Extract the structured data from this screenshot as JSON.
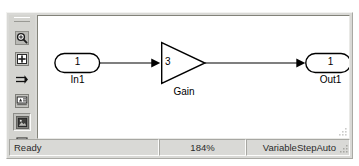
{
  "window": {
    "name": "simulink-model-window"
  },
  "toolbar": {
    "name": "simulink-left-toolbar",
    "items": [
      {
        "icon": "zoom-magnifier-icon",
        "label": "Zoom",
        "pressed": false
      },
      {
        "icon": "fit-to-view-icon",
        "label": "Fit to view",
        "pressed": false
      },
      {
        "icon": "signal-flow-arrow-icon",
        "label": "Signal flow",
        "pressed": false
      },
      {
        "icon": "label-block-icon",
        "label": "Block label",
        "pressed": false
      },
      {
        "icon": "image-block-icon",
        "label": "Image block",
        "pressed": true
      },
      {
        "icon": "empty-square-icon",
        "label": "Select region",
        "pressed": false
      }
    ]
  },
  "canvas": {
    "name": "model-canvas",
    "resize_grip_icon": "resize-grip-icon",
    "blocks": [
      {
        "id": "in1",
        "type": "inport",
        "value": "1",
        "label": "In1",
        "x": 48,
        "y": 47,
        "w": 44,
        "h": 20
      },
      {
        "id": "gain",
        "type": "gain",
        "value": "3",
        "label": "Gain",
        "x": 155,
        "y": 38,
        "w": 42,
        "h": 38
      },
      {
        "id": "out1",
        "type": "outport",
        "value": "1",
        "label": "Out1",
        "x": 288,
        "y": 47,
        "w": 44,
        "h": 20
      }
    ],
    "signals": [
      {
        "id": "in1-to-gain",
        "from": "in1",
        "to": "gain"
      },
      {
        "id": "gain-to-out1",
        "from": "gain",
        "to": "out1"
      }
    ]
  },
  "status_bar": {
    "name": "status-bar",
    "ready_text": "Ready",
    "zoom_text": "184%",
    "solver_text": "VariableStepAuto",
    "grip_icon": "resize-grip-icon"
  },
  "colors": {
    "window_face": "#d9d9d6",
    "canvas": "#ffffff",
    "line": "#000000",
    "text": "#000000"
  }
}
